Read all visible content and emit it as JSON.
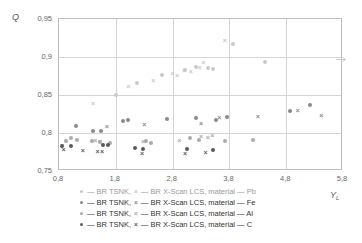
{
  "chart_data": {
    "type": "scatter",
    "title": "",
    "xlabel": "Y_L",
    "ylabel": "Q",
    "xlim": [
      0.8,
      5.8
    ],
    "ylim": [
      0.75,
      0.95
    ],
    "xticks": [
      "0,8",
      "1,8",
      "2,8",
      "3,8",
      "4,8",
      "5,8"
    ],
    "xtick_values": [
      0.8,
      1.8,
      2.8,
      3.8,
      4.8,
      5.8
    ],
    "yticks": [
      "0,75",
      "0,8",
      "0,85",
      "0,9",
      "0,95"
    ],
    "ytick_values": [
      0.75,
      0.8,
      0.85,
      0.9,
      0.95
    ],
    "grid": true,
    "legend_position": "below",
    "series": [
      {
        "name": "BR TSNK, material — Pb",
        "marker": "dot",
        "color": "#c9c9c9",
        "points": [
          [
            1.8,
            0.8505
          ],
          [
            2.18,
            0.8655
          ],
          [
            2.62,
            0.8765
          ],
          [
            3.02,
            0.8835
          ],
          [
            3.22,
            0.887
          ],
          [
            3.42,
            0.8855
          ],
          [
            3.52,
            0.8845
          ],
          [
            4.42,
            0.893
          ],
          [
            3.86,
            0.9165
          ]
        ]
      },
      {
        "name": "BR X-Scan LCS, material — Pb",
        "marker": "x",
        "color": "#c9c9c9",
        "points": [
          [
            1.4,
            0.8395
          ],
          [
            2.02,
            0.862
          ],
          [
            2.46,
            0.87
          ],
          [
            2.8,
            0.879
          ],
          [
            2.88,
            0.8765
          ],
          [
            3.0,
            0.8835
          ],
          [
            3.12,
            0.882
          ],
          [
            3.28,
            0.8875
          ],
          [
            3.34,
            0.894
          ],
          [
            3.72,
            0.9225
          ]
        ]
      },
      {
        "name": "BR TSNK, material — Fe",
        "marker": "dot",
        "color": "#8a8a8a",
        "points": [
          [
            1.1,
            0.809
          ],
          [
            1.4,
            0.8025
          ],
          [
            1.54,
            0.803
          ],
          [
            1.92,
            0.8155
          ],
          [
            2.02,
            0.8165
          ],
          [
            2.7,
            0.8185
          ],
          [
            3.22,
            0.82
          ],
          [
            3.56,
            0.8175
          ],
          [
            3.76,
            0.821
          ],
          [
            4.86,
            0.8285
          ],
          [
            5.22,
            0.837
          ]
        ]
      },
      {
        "name": "BR X-Scan LCS, material — Fe",
        "marker": "x",
        "color": "#8a8a8a",
        "points": [
          [
            1.64,
            0.8095
          ],
          [
            2.3,
            0.812
          ],
          [
            3.3,
            0.8135
          ],
          [
            3.62,
            0.8205
          ],
          [
            4.3,
            0.823
          ],
          [
            5.0,
            0.83
          ],
          [
            5.42,
            0.824
          ]
        ]
      },
      {
        "name": "BR TSNK, material — Al",
        "marker": "dot",
        "color": "#aaaaaa",
        "points": [
          [
            0.92,
            0.789
          ],
          [
            1.02,
            0.794
          ],
          [
            1.12,
            0.7905
          ],
          [
            1.38,
            0.7895
          ],
          [
            1.52,
            0.788
          ],
          [
            1.7,
            0.7875
          ],
          [
            2.34,
            0.789
          ],
          [
            2.42,
            0.787
          ],
          [
            3.1,
            0.7935
          ],
          [
            3.26,
            0.7905
          ],
          [
            3.72,
            0.79
          ],
          [
            4.22,
            0.7905
          ]
        ]
      },
      {
        "name": "BR X-Scan LCS, material — Al",
        "marker": "x",
        "color": "#aaaaaa",
        "points": [
          [
            0.86,
            0.7845
          ],
          [
            1.44,
            0.791
          ],
          [
            1.52,
            0.79
          ],
          [
            2.28,
            0.79
          ],
          [
            2.92,
            0.7905
          ],
          [
            3.3,
            0.796
          ],
          [
            3.42,
            0.795
          ],
          [
            3.5,
            0.7975
          ]
        ]
      },
      {
        "name": "BR TSNK, material — C",
        "marker": "dot",
        "color": "#5a5a5a",
        "points": [
          [
            0.86,
            0.783
          ],
          [
            1.02,
            0.783
          ],
          [
            1.58,
            0.7845
          ],
          [
            1.66,
            0.784
          ],
          [
            2.14,
            0.7805
          ],
          [
            2.28,
            0.779
          ],
          [
            3.06,
            0.779
          ],
          [
            3.52,
            0.777
          ]
        ]
      },
      {
        "name": "BR X-Scan LCS, material — C",
        "marker": "x",
        "color": "#5a5a5a",
        "points": [
          [
            0.88,
            0.7795
          ],
          [
            1.22,
            0.777
          ],
          [
            1.48,
            0.7765
          ],
          [
            1.56,
            0.776
          ],
          [
            2.26,
            0.774
          ],
          [
            3.02,
            0.7735
          ],
          [
            3.38,
            0.7755
          ]
        ]
      }
    ]
  },
  "axes": {
    "y_axis_label": "Q",
    "x_axis_label": "Y",
    "x_axis_label_sub": "L"
  },
  "legend": {
    "rows": [
      {
        "dot_label": "— BR TSNK,",
        "x_label": "— BR X-Scan LCS, material — Pb",
        "color": "#c9c9c9"
      },
      {
        "dot_label": "— BR TSNK,",
        "x_label": "— BR X-Scan LCS, material — Fe",
        "color": "#8a8a8a"
      },
      {
        "dot_label": "— BR TSNK,",
        "x_label": "— BR X-Scan LCS, material — Al",
        "color": "#aaaaaa"
      },
      {
        "dot_label": "— BR TSNK,",
        "x_label": "— BR X-Scan LCS, material — C",
        "color": "#5a5a5a"
      }
    ]
  }
}
